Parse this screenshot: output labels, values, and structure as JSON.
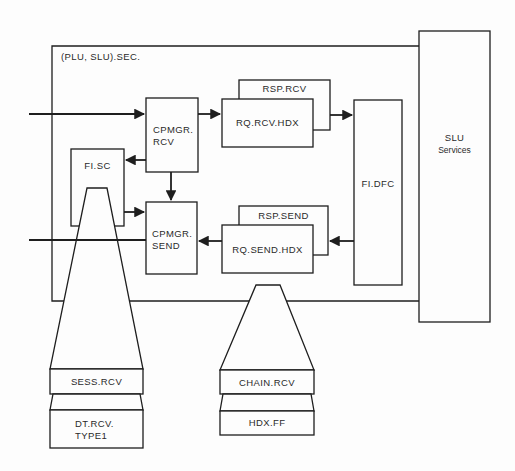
{
  "diagram": {
    "container": {
      "label": "(PLU, SLU).SEC."
    },
    "slu_services": {
      "line1": "SLU",
      "line2": "Services"
    },
    "boxes": {
      "cpmgr_rcv": {
        "line1": "CPMGR.",
        "line2": "RCV"
      },
      "cpmgr_send": {
        "line1": "CPMGR.",
        "line2": "SEND"
      },
      "fi_sc": "FI.SC",
      "rsp_rcv": "RSP.RCV",
      "rq_rcv_hdx": "RQ.RCV.HDX",
      "fi_dfc": "FI.DFC",
      "rsp_send": "RSP.SEND",
      "rq_send_hdx": "RQ.SEND.HDX"
    },
    "stacks": [
      {
        "top": "SESS.RCV",
        "bottom_line1": "DT.RCV.",
        "bottom_line2": "TYPE1"
      },
      {
        "top": "CHAIN.RCV",
        "bottom_line1": "HDX.FF"
      }
    ],
    "colors": {
      "line": "#1e1e1e",
      "background": "#fdfdfd"
    }
  }
}
